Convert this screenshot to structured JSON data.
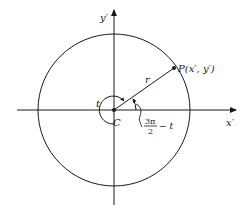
{
  "diagram": {
    "type": "unit-circle-rotation",
    "colors": {
      "stroke": "#1a1a1a",
      "background": "#ffffff"
    },
    "labels": {
      "y_axis": "y′",
      "x_axis": "x′",
      "point": "P(x′, y′)",
      "radius": "r",
      "angle_t": "t",
      "center": "C",
      "angle2_num": "3π",
      "angle2_den": "2",
      "angle2_rest": "− t"
    },
    "geometry": {
      "center": [
        114,
        110
      ],
      "radius": 76,
      "point": [
        174,
        68
      ]
    }
  }
}
